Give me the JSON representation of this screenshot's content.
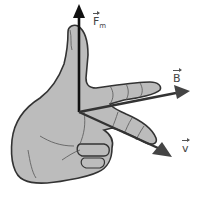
{
  "diagram": {
    "vectors": [
      {
        "id": "force",
        "symbol": "F",
        "subscript": "m",
        "direction": "up"
      },
      {
        "id": "field",
        "symbol": "B",
        "subscript": "",
        "direction": "right"
      },
      {
        "id": "velocity",
        "symbol": "v",
        "subscript": "",
        "direction": "down-right"
      }
    ],
    "colors": {
      "hand_fill": "#b8b8b8",
      "hand_outline": "#333333",
      "arrow": "#222222",
      "arrow_gray": "#444444",
      "background": "#ffffff"
    }
  }
}
